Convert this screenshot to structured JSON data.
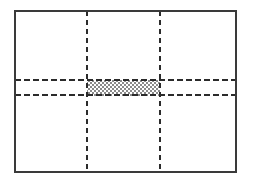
{
  "figure": {
    "canvas": {
      "width": 253,
      "height": 185,
      "background_color": "#ffffff"
    },
    "outer_frame": {
      "label": "Domain boundary",
      "x": 15,
      "y": 11,
      "width": 221,
      "height": 161,
      "stroke_color": "#3a3a3a",
      "stroke_width": 1.6,
      "fill": "none",
      "line_style": "solid"
    },
    "vertical_guides": [
      {
        "label": "Left vertical guide",
        "x": 87,
        "y_start": 11,
        "y_end": 172,
        "stroke_color": "#2b2b2b",
        "stroke_width": 1.3,
        "dash_pattern": "5 4"
      },
      {
        "label": "Right vertical guide",
        "x": 160,
        "y_start": 11,
        "y_end": 172,
        "stroke_color": "#2b2b2b",
        "stroke_width": 1.3,
        "dash_pattern": "5 4"
      }
    ],
    "horizontal_guides": [
      {
        "label": "Upper horizontal guide",
        "y": 80,
        "x_start": 15,
        "x_end": 236,
        "stroke_color": "#2b2b2b",
        "stroke_width": 1.3,
        "dash_pattern": "6 3"
      },
      {
        "label": "Lower horizontal guide",
        "y": 95,
        "x_start": 15,
        "x_end": 236,
        "stroke_color": "#2b2b2b",
        "stroke_width": 1.3,
        "dash_pattern": "6 3"
      }
    ],
    "shaded_region": {
      "label": "Shaded central band",
      "x": 87,
      "y": 80,
      "width": 73,
      "height": 16,
      "fill_style": "checkerboard-dither",
      "fill_color": "#8a8a8a",
      "fill_background": "#ffffff",
      "pattern_cell_size": 2
    }
  }
}
